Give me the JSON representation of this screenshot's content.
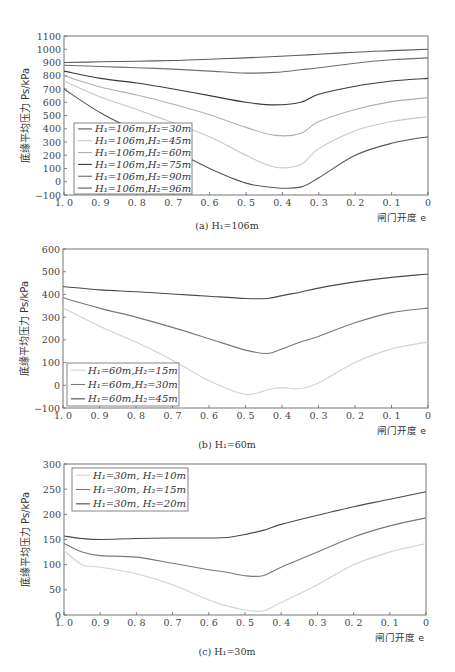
{
  "chart_data": [
    {
      "type": "line",
      "panel": "a",
      "caption": "(a) H1=106m",
      "xlabel": "闸门开度 e",
      "ylabel": "底缘平均压力 Ps/kPa",
      "x": [
        1.0,
        0.9,
        0.8,
        0.7,
        0.6,
        0.5,
        0.42,
        0.35,
        0.3,
        0.2,
        0.1,
        0.0
      ],
      "xticks": [
        "1.0",
        "0.9",
        "0.8",
        "0.7",
        "0.6",
        "0.5",
        "0.4",
        "0.3",
        "0.2",
        "0.1",
        "0"
      ],
      "yticks": [
        1100,
        1000,
        900,
        800,
        700,
        600,
        500,
        400,
        300,
        200,
        100,
        0,
        -100
      ],
      "ylim": [
        -100,
        1100
      ],
      "xlim": [
        1.0,
        0.0
      ],
      "grid": false,
      "legend_position": "lower-left",
      "series": [
        {
          "name": "H1=106m, H2=30m",
          "color": "#555555",
          "values": [
            700,
            520,
            380,
            240,
            100,
            -10,
            -45,
            -40,
            30,
            200,
            290,
            340
          ]
        },
        {
          "name": "H1=106m, H2=45m",
          "color": "#c8c8c8",
          "values": [
            760,
            640,
            545,
            445,
            340,
            200,
            110,
            130,
            250,
            385,
            455,
            490
          ]
        },
        {
          "name": "H1=106m, H2=60m",
          "color": "#b0b0b0",
          "values": [
            800,
            715,
            655,
            585,
            505,
            410,
            350,
            365,
            455,
            545,
            605,
            635
          ]
        },
        {
          "name": "H1=106m, H2=75m",
          "color": "#3a3a3a",
          "values": [
            835,
            780,
            745,
            700,
            650,
            600,
            580,
            600,
            660,
            720,
            760,
            780
          ]
        },
        {
          "name": "H1=106m, H2=90m",
          "color": "#6e6e6e",
          "values": [
            880,
            870,
            860,
            850,
            835,
            820,
            825,
            845,
            860,
            895,
            920,
            935
          ]
        },
        {
          "name": "H1=106m, H2=96m",
          "color": "#5a5a5a",
          "values": [
            900,
            905,
            910,
            915,
            925,
            935,
            945,
            955,
            962,
            978,
            990,
            1000
          ]
        }
      ]
    },
    {
      "type": "line",
      "panel": "b",
      "caption": "(b) H1=60m",
      "xlabel": "闸门开度 e",
      "ylabel": "底缘平均压力 Ps/kPa",
      "x": [
        1.0,
        0.9,
        0.8,
        0.7,
        0.6,
        0.5,
        0.44,
        0.4,
        0.35,
        0.3,
        0.2,
        0.1,
        0.0
      ],
      "xticks": [
        "1.0",
        "0.9",
        "0.8",
        "0.7",
        "0.6",
        "0.5",
        "0.4",
        "0.3",
        "0.2",
        "0.1",
        "0"
      ],
      "yticks": [
        600,
        500,
        400,
        300,
        200,
        100,
        0,
        -100
      ],
      "ylim": [
        -100,
        600
      ],
      "xlim": [
        1.0,
        0.0
      ],
      "grid": false,
      "legend_position": "lower-left",
      "series": [
        {
          "name": "H1=60m, H2=15m",
          "color": "#d2d2d2",
          "values": [
            340,
            260,
            190,
            110,
            20,
            -40,
            -20,
            -10,
            -15,
            10,
            100,
            160,
            190
          ]
        },
        {
          "name": "H1=60m, H2=30m",
          "color": "#777777",
          "values": [
            385,
            340,
            300,
            255,
            205,
            155,
            140,
            160,
            190,
            215,
            275,
            320,
            340
          ]
        },
        {
          "name": "H1=60m, H2=45m",
          "color": "#4a4a4a",
          "values": [
            435,
            420,
            412,
            402,
            392,
            382,
            382,
            395,
            410,
            428,
            455,
            475,
            490
          ]
        }
      ]
    },
    {
      "type": "line",
      "panel": "c",
      "caption": "(c) H1=30m",
      "xlabel": "闸门开度 e",
      "ylabel": "底缘平均压力 Ps/kPa",
      "x": [
        1.0,
        0.95,
        0.9,
        0.8,
        0.7,
        0.6,
        0.55,
        0.5,
        0.45,
        0.4,
        0.3,
        0.2,
        0.1,
        0.0
      ],
      "xticks": [
        "1.0",
        "0.9",
        "0.8",
        "0.7",
        "0.6",
        "0.5",
        "0.4",
        "0.3",
        "0.2",
        "0.1",
        "0"
      ],
      "yticks": [
        300,
        250,
        200,
        150,
        100,
        50,
        0
      ],
      "ylim": [
        0,
        300
      ],
      "xlim": [
        1.0,
        0.0
      ],
      "grid": false,
      "legend_position": "upper-left",
      "series": [
        {
          "name": "H1=30m, H2=10m",
          "color": "#d2d2d2",
          "values": [
            128,
            100,
            95,
            82,
            60,
            30,
            18,
            10,
            8,
            25,
            60,
            100,
            125,
            142
          ]
        },
        {
          "name": "H1=30m, H2=15m",
          "color": "#777777",
          "values": [
            142,
            125,
            118,
            115,
            103,
            90,
            85,
            78,
            78,
            95,
            125,
            155,
            177,
            193
          ]
        },
        {
          "name": "H1=30m, H2=20m",
          "color": "#4a4a4a",
          "values": [
            157,
            152,
            150,
            152,
            153,
            153,
            154,
            160,
            168,
            180,
            198,
            215,
            230,
            245
          ]
        }
      ]
    }
  ],
  "labels": {
    "ylabel": "底缘平均压力 Ps/kPa",
    "xlabel": "闸门开度 e",
    "caption_a": "(a) H₁=106m",
    "caption_b": "(b) H₁=60m",
    "caption_c": "(c) H₁=30m",
    "legend_a": [
      "H₁=106m,H₂=30m",
      "H₁=106m,H₂=45m",
      "H₁=106m,H₂=60m",
      "H₁=106m,H₂=75m",
      "H₁=106m,H₂=90m",
      "H₁=106m,H₂=96m"
    ],
    "legend_b": [
      "H₁=60m,H₂=15m",
      "H₁=60m,H₂=30m",
      "H₁=60m,H₂=45m"
    ],
    "legend_c": [
      "H₁=30m, H₂=10m",
      "H₁=30m, H₂=15m",
      "H₁=30m, H₂=20m"
    ]
  }
}
